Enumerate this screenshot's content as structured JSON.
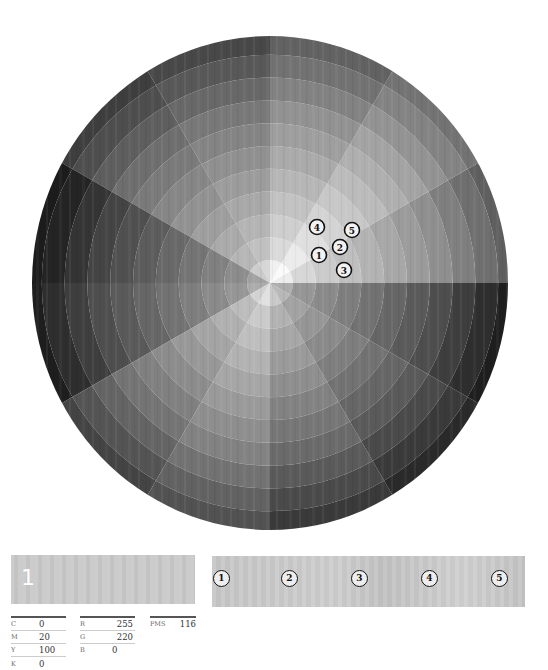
{
  "wheel": {
    "center": [
      270,
      283
    ],
    "radius_x": 238,
    "radius_y": 247,
    "sectors": 12,
    "rings": 10,
    "inner_disc_radius": 23,
    "sector_base_gray": [
      215,
      235,
      218,
      192,
      182,
      140,
      150,
      188,
      202,
      178,
      162,
      150
    ],
    "ring_step": 12,
    "markers": [
      {
        "label": "1",
        "x": 319,
        "y": 255
      },
      {
        "label": "2",
        "x": 340,
        "y": 247
      },
      {
        "label": "3",
        "x": 344,
        "y": 270
      },
      {
        "label": "4",
        "x": 317,
        "y": 227
      },
      {
        "label": "5",
        "x": 352,
        "y": 230
      }
    ]
  },
  "selected_swatch": {
    "number": "1",
    "color": "#c9c9c9"
  },
  "swatch_strip": {
    "chips": [
      "1",
      "2",
      "3",
      "4",
      "5"
    ],
    "chip_x": [
      222,
      290,
      360,
      430,
      500
    ]
  },
  "cmyk": {
    "rows": [
      {
        "label": "C",
        "value": "0"
      },
      {
        "label": "M",
        "value": "20"
      },
      {
        "label": "Y",
        "value": "100"
      },
      {
        "label": "K",
        "value": "0"
      }
    ]
  },
  "rgb": {
    "rows": [
      {
        "label": "R",
        "value": "255"
      },
      {
        "label": "G",
        "value": "220"
      },
      {
        "label": "B",
        "value": "0"
      }
    ]
  },
  "pms": {
    "label": "PMS",
    "value": "116"
  }
}
